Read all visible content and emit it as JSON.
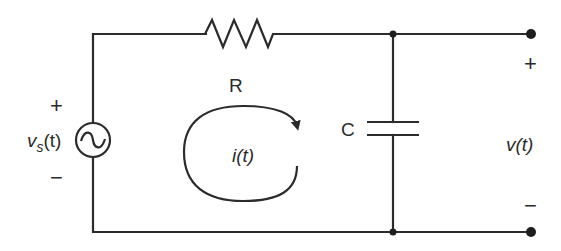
{
  "diagram": {
    "type": "RC circuit",
    "components": {
      "source": {
        "label_main": "v",
        "label_sub": "s",
        "label_arg": "(t)",
        "plus": "+",
        "minus": "−",
        "symbol": "ac-source-icon"
      },
      "resistor": {
        "label": "R"
      },
      "capacitor": {
        "label": "C"
      },
      "current": {
        "label": "i(t)",
        "direction": "clockwise"
      },
      "output": {
        "label": "v(t)",
        "plus": "+",
        "minus": "−"
      }
    },
    "colors": {
      "line": "#2b2b2b",
      "background": "#ffffff"
    }
  }
}
